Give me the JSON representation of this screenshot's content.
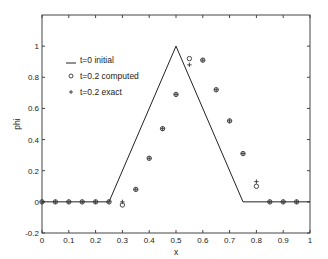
{
  "chart_data": {
    "type": "line",
    "title": "",
    "xlabel": "x",
    "ylabel": "phi",
    "xlim": [
      0,
      1
    ],
    "ylim": [
      -0.2,
      1.2
    ],
    "grid": false,
    "legend_position": "upper-left",
    "x_ticks": [
      "0",
      "0.1",
      "0.2",
      "0.3",
      "0.4",
      "0.5",
      "0.6",
      "0.7",
      "0.8",
      "0.9",
      "1"
    ],
    "y_ticks": [
      "-0.2",
      "0",
      "0.2",
      "0.4",
      "0.6",
      "0.8",
      "1"
    ],
    "legend": [
      {
        "symbol": "line",
        "label": "t=0 initial"
      },
      {
        "symbol": "circle",
        "label": "t=0.2 computed"
      },
      {
        "symbol": "plus",
        "label": "t=0.2 exact"
      }
    ],
    "series": [
      {
        "name": "t=0 initial",
        "style": "line",
        "x": [
          0,
          0.25,
          0.5,
          0.75,
          1.0
        ],
        "y": [
          0,
          0,
          1.0,
          0,
          0
        ]
      },
      {
        "name": "t=0.2 computed",
        "style": "circle",
        "x": [
          0,
          0.05,
          0.1,
          0.15,
          0.2,
          0.25,
          0.3,
          0.35,
          0.4,
          0.45,
          0.5,
          0.55,
          0.6,
          0.65,
          0.7,
          0.75,
          0.8,
          0.85,
          0.9,
          0.95
        ],
        "y": [
          0,
          0,
          0,
          0,
          0,
          0,
          -0.02,
          0.08,
          0.28,
          0.47,
          0.69,
          0.92,
          0.91,
          0.72,
          0.52,
          0.31,
          0.1,
          0,
          0,
          0
        ]
      },
      {
        "name": "t=0.2 exact",
        "style": "plus",
        "x": [
          0,
          0.05,
          0.1,
          0.15,
          0.2,
          0.25,
          0.3,
          0.35,
          0.4,
          0.45,
          0.5,
          0.55,
          0.6,
          0.65,
          0.7,
          0.75,
          0.8,
          0.85,
          0.9,
          0.95
        ],
        "y": [
          0,
          0,
          0,
          0,
          0,
          0,
          0,
          0.08,
          0.28,
          0.47,
          0.69,
          0.88,
          0.91,
          0.72,
          0.52,
          0.31,
          0.13,
          0,
          0,
          0
        ]
      }
    ]
  }
}
